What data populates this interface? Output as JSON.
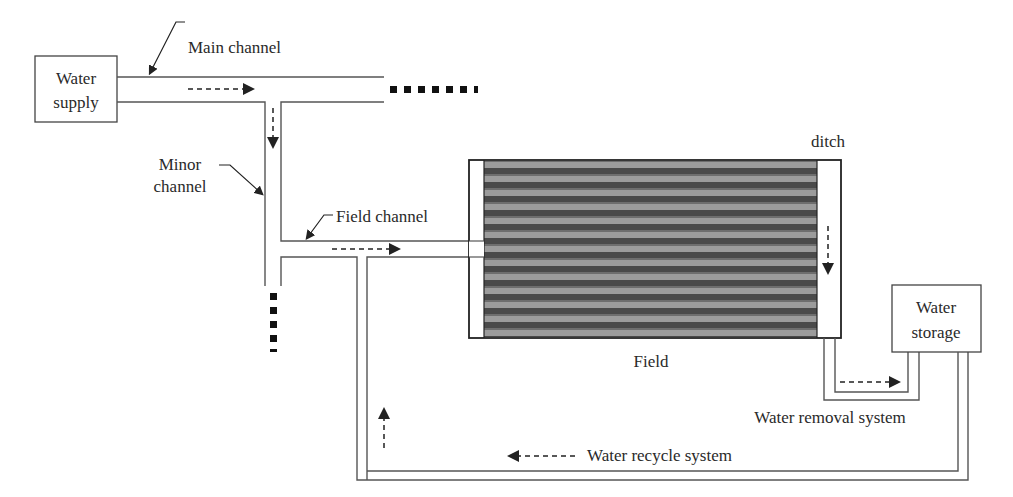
{
  "diagram": {
    "nodes": {
      "water_supply": {
        "line1": "Water",
        "line2": "supply"
      },
      "water_storage": {
        "line1": "Water",
        "line2": "storage"
      },
      "field": {
        "label": "Field"
      },
      "ditch": {
        "label": "ditch"
      }
    },
    "channels": {
      "main": {
        "label": "Main channel"
      },
      "minor": {
        "line1": "Minor",
        "line2": "channel"
      },
      "field": {
        "label": "Field channel"
      }
    },
    "systems": {
      "removal": {
        "label": "Water removal system"
      },
      "recycle": {
        "label": "Water recycle system"
      }
    },
    "colors": {
      "line": "#555555",
      "text": "#2a2a2a",
      "field_dark": "#4a4a4a",
      "field_light": "#a8a8a8"
    }
  }
}
